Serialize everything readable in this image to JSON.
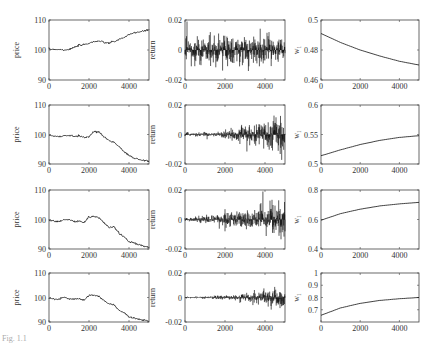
{
  "figure": {
    "caption_fragment": "Fig. 1.1"
  },
  "chart_data": [
    {
      "type": "line",
      "row": 1,
      "col": 1,
      "ylabel": "price",
      "xlim": [
        0,
        5000
      ],
      "ylim": [
        90,
        110
      ],
      "xticks": [
        "0",
        "2000",
        "4000"
      ],
      "yticks": [
        "90",
        "100",
        "110"
      ],
      "x": [
        0,
        250,
        500,
        750,
        1000,
        1250,
        1500,
        1750,
        2000,
        2250,
        2500,
        2750,
        3000,
        3250,
        3500,
        3750,
        4000,
        4250,
        4500,
        4750,
        5000
      ],
      "values": [
        100.2,
        100.3,
        100.2,
        100.0,
        100.2,
        100.8,
        101.5,
        101.8,
        102.3,
        102.8,
        103.0,
        102.5,
        102.3,
        102.8,
        103.5,
        104.2,
        105.0,
        105.8,
        106.0,
        106.3,
        106.8
      ]
    },
    {
      "type": "line",
      "row": 1,
      "col": 2,
      "ylabel": "return",
      "xlim": [
        0,
        5000
      ],
      "ylim": [
        -0.02,
        0.02
      ],
      "xticks": [
        "0",
        "2000",
        "4000"
      ],
      "yticks": [
        "-0.02",
        "0",
        "0.02"
      ],
      "description": "noisy returns, roughly constant amplitude ~0.007 with spikes to ~0.015"
    },
    {
      "type": "line",
      "row": 1,
      "col": 3,
      "ylabel": "w1",
      "xlim": [
        0,
        5000
      ],
      "ylim": [
        0.46,
        0.5
      ],
      "xticks": [
        "0",
        "2000",
        "4000"
      ],
      "yticks": [
        "0.46",
        "0.48",
        "0.5"
      ],
      "x": [
        0,
        1000,
        2000,
        3000,
        4000,
        5000
      ],
      "values": [
        0.491,
        0.485,
        0.48,
        0.476,
        0.4725,
        0.47
      ]
    },
    {
      "type": "line",
      "row": 2,
      "col": 1,
      "ylabel": "price",
      "xlim": [
        0,
        5000
      ],
      "ylim": [
        90,
        110
      ],
      "xticks": [
        "0",
        "2000",
        "4000"
      ],
      "yticks": [
        "90",
        "100",
        "110"
      ],
      "x": [
        0,
        250,
        500,
        750,
        1000,
        1250,
        1500,
        1750,
        2000,
        2250,
        2500,
        2750,
        3000,
        3250,
        3500,
        3750,
        4000,
        4250,
        4500,
        4750,
        5000
      ],
      "values": [
        99.8,
        99.4,
        99.3,
        99.5,
        99.8,
        99.4,
        99.6,
        99.0,
        99.2,
        101.0,
        100.9,
        99.2,
        98.0,
        97.4,
        95.8,
        94.2,
        92.9,
        92.0,
        91.5,
        91.2,
        91.0
      ]
    },
    {
      "type": "line",
      "row": 2,
      "col": 2,
      "ylabel": "return",
      "xlim": [
        0,
        5000
      ],
      "ylim": [
        -0.02,
        0.02
      ],
      "xticks": [
        "0",
        "2000",
        "4000"
      ],
      "yticks": [
        "-0.02",
        "0",
        "0.02"
      ],
      "description": "returns with amplitude increasing over time"
    },
    {
      "type": "line",
      "row": 2,
      "col": 3,
      "ylabel": "w1",
      "xlim": [
        0,
        5000
      ],
      "ylim": [
        0.5,
        0.6
      ],
      "xticks": [
        "0",
        "2000",
        "4000"
      ],
      "yticks": [
        "0.5",
        "0.55",
        "0.6"
      ],
      "x": [
        0,
        1000,
        2000,
        3000,
        4000,
        5000
      ],
      "values": [
        0.514,
        0.524,
        0.533,
        0.54,
        0.545,
        0.548
      ]
    },
    {
      "type": "line",
      "row": 3,
      "col": 1,
      "ylabel": "price",
      "xlim": [
        0,
        5000
      ],
      "ylim": [
        90,
        110
      ],
      "xticks": [
        "0",
        "2000",
        "4000"
      ],
      "yticks": [
        "90",
        "100",
        "110"
      ],
      "x": [
        0,
        250,
        500,
        750,
        1000,
        1250,
        1500,
        1750,
        2000,
        2250,
        2500,
        2750,
        3000,
        3250,
        3500,
        3750,
        4000,
        4250,
        4500,
        4750,
        5000
      ],
      "values": [
        99.8,
        99.4,
        99.3,
        99.8,
        100.0,
        99.3,
        99.5,
        98.9,
        100.9,
        101.0,
        100.6,
        98.9,
        97.4,
        97.6,
        95.3,
        94.2,
        92.4,
        92.0,
        91.4,
        91.0,
        90.5
      ]
    },
    {
      "type": "line",
      "row": 3,
      "col": 2,
      "ylabel": "return",
      "xlim": [
        0,
        5000
      ],
      "ylim": [
        -0.02,
        0.02
      ],
      "xticks": [
        "0",
        "2000",
        "4000"
      ],
      "yticks": [
        "-0.02",
        "0",
        "0.02"
      ],
      "description": "small returns growing in amplitude, spike near t=2000"
    },
    {
      "type": "line",
      "row": 3,
      "col": 3,
      "ylabel": "w1",
      "xlim": [
        0,
        5000
      ],
      "ylim": [
        0.4,
        0.8
      ],
      "xticks": [
        "0",
        "2000",
        "4000"
      ],
      "yticks": [
        "0.4",
        "0.6",
        "0.8"
      ],
      "x": [
        0,
        1000,
        2000,
        3000,
        4000,
        5000
      ],
      "values": [
        0.595,
        0.64,
        0.67,
        0.692,
        0.706,
        0.716
      ]
    },
    {
      "type": "line",
      "row": 4,
      "col": 1,
      "ylabel": "price",
      "xlim": [
        0,
        5000
      ],
      "ylim": [
        90,
        110
      ],
      "xticks": [
        "0",
        "2000",
        "4000"
      ],
      "yticks": [
        "90",
        "100",
        "110"
      ],
      "x": [
        0,
        250,
        500,
        750,
        1000,
        1250,
        1500,
        1750,
        2000,
        2250,
        2500,
        2750,
        3000,
        3250,
        3500,
        3750,
        4000,
        4250,
        4500,
        4750,
        5000
      ],
      "values": [
        99.7,
        99.4,
        99.3,
        100.2,
        99.5,
        99.3,
        99.5,
        98.9,
        100.8,
        101.0,
        100.5,
        98.7,
        97.5,
        97.0,
        94.8,
        93.9,
        92.0,
        91.7,
        91.0,
        90.8,
        90.3
      ]
    },
    {
      "type": "line",
      "row": 4,
      "col": 2,
      "ylabel": "return",
      "xlim": [
        0,
        5000
      ],
      "ylim": [
        -0.02,
        0.02
      ],
      "xticks": [
        "0",
        "2000",
        "4000"
      ],
      "yticks": [
        "-0.02",
        "0",
        "0.02"
      ],
      "description": "very small returns growing toward end"
    },
    {
      "type": "line",
      "row": 4,
      "col": 3,
      "ylabel": "w1",
      "xlim": [
        0,
        5000
      ],
      "ylim": [
        0.6,
        1.0
      ],
      "xticks": [
        "0",
        "2000",
        "4000"
      ],
      "yticks": [
        "0.7",
        "0.8",
        "0.9",
        "1"
      ],
      "x": [
        0,
        1000,
        2000,
        3000,
        4000,
        5000
      ],
      "values": [
        0.655,
        0.715,
        0.752,
        0.776,
        0.79,
        0.8
      ]
    }
  ]
}
